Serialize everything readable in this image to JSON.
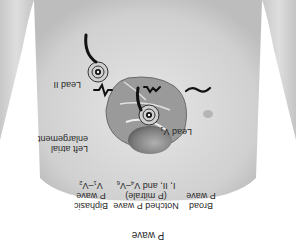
{
  "figure": {
    "title": "P wave",
    "leads": {
      "lead_ii": "Lead II",
      "lead_v1_prefix": "Lead V",
      "lead_v1_sub": "1"
    },
    "annotation": {
      "line1": "Left atrial",
      "line2": "enlargement"
    },
    "waveforms": [
      {
        "name": "broad",
        "line1": "Broad",
        "line2": "P wave",
        "line3": ""
      },
      {
        "name": "notched",
        "line1": "Notched P wave",
        "line2": "(P mitrale)",
        "line3_prefix": "I, II, and V",
        "line3_sub1": "4",
        "line3_mid": "–V",
        "line3_sub2": "6"
      },
      {
        "name": "biphasic",
        "line1": "Biphasic",
        "line2": "P wave",
        "line3_prefix": "V",
        "line3_sub1": "1",
        "line3_mid": "–V",
        "line3_sub2": "2"
      }
    ],
    "colors": {
      "skin": "#d9d9d9",
      "skin_shadow": "#b8b8b8",
      "background": "#ffffff",
      "lead_wire": "#111111",
      "heart": "#8a8a8a",
      "text": "#2a2a2a"
    }
  }
}
